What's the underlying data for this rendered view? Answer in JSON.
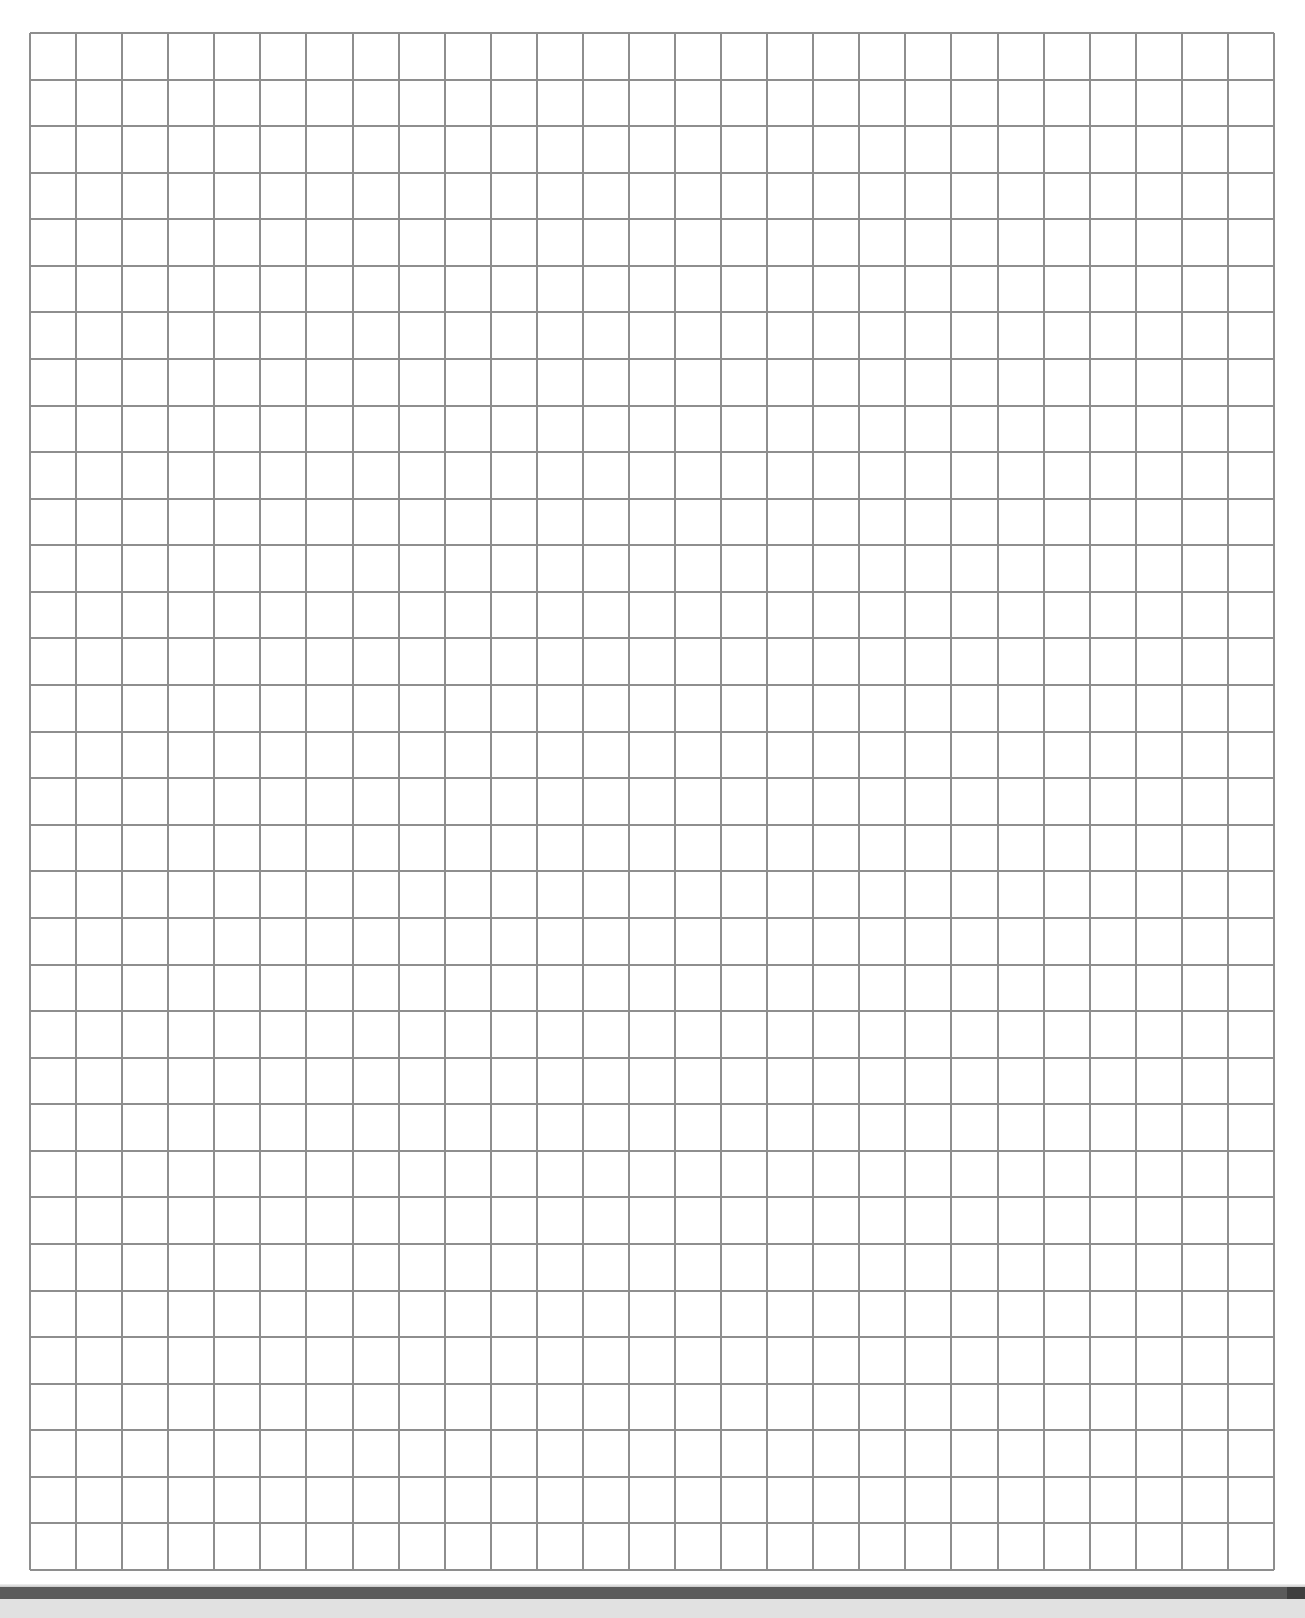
{
  "document": {
    "type": "graph-paper",
    "page_background": "#ffffff",
    "grid": {
      "columns": 27,
      "rows": 33,
      "left": 30,
      "top": 33,
      "width": 1244,
      "height": 1537,
      "line_color": "#8e8e8e",
      "line_width": 2
    }
  },
  "viewer": {
    "page_divider_color": "#5b5b5b",
    "gap_color": "#e1e1e1"
  }
}
